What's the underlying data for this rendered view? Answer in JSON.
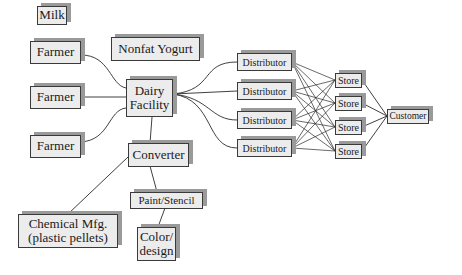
{
  "diagram": {
    "type": "supply-chain flow diagram",
    "nodes": {
      "milk": "Milk",
      "farmer_1": "Farmer",
      "farmer_2": "Farmer",
      "farmer_3": "Farmer",
      "nonfat_yogurt": "Nonfat Yogurt",
      "dairy_facility": "Dairy\nFacility",
      "converter": "Converter",
      "paint_stencil": "Paint/Stencil",
      "color_design": "Color/\ndesign",
      "chemical_mfg": "Chemical Mfg.\n(plastic pellets)",
      "distributors": [
        "Distributor",
        "Distributor",
        "Distributor",
        "Distributor"
      ],
      "stores": [
        "Store",
        "Store",
        "Store",
        "Store"
      ],
      "customer": "Customer"
    },
    "edges": [
      [
        "farmer_1",
        "dairy_facility"
      ],
      [
        "farmer_2",
        "dairy_facility"
      ],
      [
        "farmer_3",
        "dairy_facility"
      ],
      [
        "dairy_facility",
        "converter"
      ],
      [
        "converter",
        "chemical_mfg"
      ],
      [
        "converter",
        "paint_stencil"
      ],
      [
        "paint_stencil",
        "color_design"
      ],
      [
        "dairy_facility",
        "distributor_1"
      ],
      [
        "dairy_facility",
        "distributor_2"
      ],
      [
        "dairy_facility",
        "distributor_3"
      ],
      [
        "dairy_facility",
        "distributor_4"
      ],
      [
        "distributor_*",
        "store_*",
        "all-to-all"
      ],
      [
        "store_1",
        "customer"
      ],
      [
        "store_2",
        "customer"
      ],
      [
        "store_3",
        "customer"
      ],
      [
        "store_4",
        "customer"
      ]
    ],
    "colors": {
      "box_fill": "#ececec",
      "box_border": "#3a3a3a",
      "shadow": "#9a9a9a",
      "line": "#2a2a2a"
    }
  }
}
